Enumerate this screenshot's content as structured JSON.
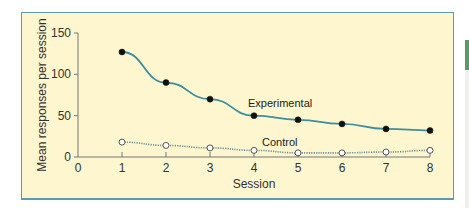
{
  "chart_data": {
    "type": "line",
    "title": "",
    "xlabel": "Session",
    "ylabel": "Mean responses per session",
    "x": [
      1,
      2,
      3,
      4,
      5,
      6,
      7,
      8
    ],
    "xlim": [
      0,
      8
    ],
    "ylim": [
      0,
      150
    ],
    "x_ticks": [
      "0",
      "1",
      "2",
      "3",
      "4",
      "5",
      "6",
      "7",
      "8"
    ],
    "y_ticks": [
      "0",
      "50",
      "100",
      "150"
    ],
    "grid": false,
    "legend": "inline labels",
    "series": [
      {
        "name": "Experimental",
        "marker": "filled-circle",
        "line": "solid",
        "color": "#3a8fa0",
        "values": [
          127,
          90,
          70,
          50,
          45,
          40,
          34,
          32
        ]
      },
      {
        "name": "Control",
        "marker": "open-circle",
        "line": "dotted",
        "color": "#6a8f96",
        "values": [
          18,
          14,
          11,
          8,
          5,
          5,
          6,
          8
        ]
      }
    ]
  },
  "colors": {
    "panel_background": "#fdf6cf",
    "panel_border": "#5b9bb0",
    "accent_green": "#5a9a63"
  }
}
